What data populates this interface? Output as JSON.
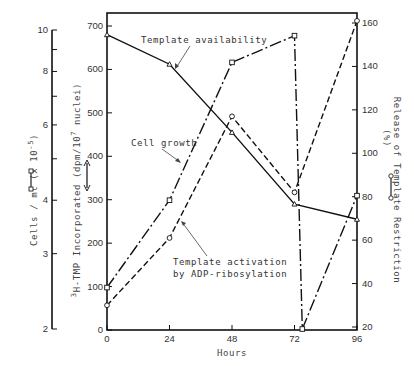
{
  "chart_data": {
    "type": "line",
    "title": "",
    "xlabel": "Hours",
    "x_ticks": [
      0,
      24,
      48,
      72,
      96
    ],
    "xlim": [
      0,
      96
    ],
    "axes": {
      "cells": {
        "label": "Cells / ml (x 10^-5)",
        "label_main": "Cells / ml (x 10",
        "label_sup": "-5",
        "label_close": ")",
        "scale": "log",
        "range": [
          2,
          10
        ],
        "tick_labels": [
          "2",
          "3",
          "4",
          "6",
          "8",
          "10"
        ],
        "minor_ticks": [
          5,
          7,
          9
        ],
        "legend_symbol": "open-square line"
      },
      "left": {
        "label": "3H-TMP Incorporated (dpm/10^7 nuclei)",
        "label_sup_pre": "3",
        "label_main": "H-TMP Incorporated (dpm/10",
        "label_sup": "7",
        "label_close": " nuclei)",
        "range": [
          0,
          700
        ],
        "tick_labels": [
          "0",
          "100",
          "200",
          "300",
          "400",
          "500",
          "600",
          "700"
        ],
        "legend_symbol": "double-headed arrow"
      },
      "right": {
        "label": "Release of Template Restriction (%)",
        "label_line1": "Release of Template Restriction",
        "label_line2": "(%)",
        "range": [
          20,
          160
        ],
        "tick_labels": [
          "20",
          "40",
          "60",
          "80",
          "100",
          "120",
          "140",
          "160"
        ],
        "legend_symbol": "open-circle line"
      }
    },
    "series": [
      {
        "name": "Template availability",
        "style": "solid, open triangles",
        "axis": "left",
        "x": [
          0,
          24,
          48,
          72,
          96
        ],
        "values": [
          680,
          612,
          455,
          290,
          255
        ]
      },
      {
        "name": "Cell growth",
        "style": "long-dash, open squares",
        "axis": "cells",
        "x": [
          0,
          24,
          48,
          72,
          96
        ],
        "values": [
          2.5,
          4.0,
          8.4,
          9.7,
          4.1
        ],
        "notes": "drops to ~2 just after 72 h before recovering at 96 h",
        "extra_point": {
          "x": 75,
          "value": 2.0
        }
      },
      {
        "name": "Template activation by ADP-ribosylation",
        "style": "short-dash, open circles",
        "axis": "right",
        "x": [
          0,
          24,
          48,
          72,
          96
        ],
        "values": [
          30,
          61,
          117,
          82,
          161
        ]
      }
    ],
    "annotations": [
      "Template availability",
      "Cell growth",
      "Template activation",
      "by ADP-ribosylation"
    ],
    "grid": false,
    "legend": "inline annotations with arrows"
  },
  "labels": {
    "xlabel": "Hours",
    "annot_template_availability": "Template availability",
    "annot_cell_growth": "Cell growth",
    "annot_activation_1": "Template activation",
    "annot_activation_2": "by ADP-ribosylation",
    "cells_axis_title": "Cells / ml (x 10",
    "cells_axis_sup": "-5",
    "cells_axis_close": ")",
    "left_axis_pre": "3",
    "left_axis_main": "H-TMP Incorporated (dpm/10",
    "left_axis_sup": "7",
    "left_axis_close": " nuclei)",
    "right_axis_line1": "Release of Template  Restriction",
    "right_axis_line2": "(%)"
  }
}
